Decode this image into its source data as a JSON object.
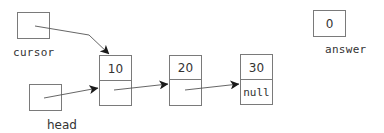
{
  "diagram": {
    "type": "linked-list",
    "colors": {
      "box_stroke": "#7a7a7a",
      "edge": "#555555",
      "text": "#333333",
      "background": "#ffffff"
    },
    "variables": [
      {
        "id": "cursor",
        "label": "cursor",
        "value": "",
        "points_to": "node-10"
      },
      {
        "id": "head",
        "label": "head",
        "value": "",
        "points_to": "node-10"
      },
      {
        "id": "answer",
        "label": "answer",
        "value": "0",
        "points_to": null
      }
    ],
    "nodes": [
      {
        "id": "node-10",
        "data": "10",
        "next": "node-20",
        "next_label": ""
      },
      {
        "id": "node-20",
        "data": "20",
        "next": "node-30",
        "next_label": ""
      },
      {
        "id": "node-30",
        "data": "30",
        "next": null,
        "next_label": "null"
      }
    ],
    "edges": [
      {
        "from": "cursor",
        "to": "node-10"
      },
      {
        "from": "head",
        "to": "node-10"
      },
      {
        "from": "node-10",
        "to": "node-20"
      },
      {
        "from": "node-20",
        "to": "node-30"
      }
    ]
  }
}
